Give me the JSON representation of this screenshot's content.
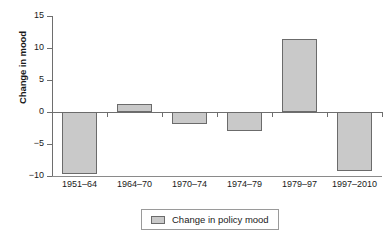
{
  "chart_data": {
    "type": "bar",
    "title": "",
    "xlabel": "",
    "ylabel": "Change in mood",
    "categories": [
      "1951–64",
      "1964–70",
      "1970–74",
      "1974–79",
      "1979–97",
      "1997–2010"
    ],
    "values": [
      -9.7,
      1.2,
      -1.8,
      -3.0,
      11.4,
      -9.2
    ],
    "series": [
      {
        "name": "Change in policy mood",
        "values": [
          -9.7,
          1.2,
          -1.8,
          -3.0,
          11.4,
          -9.2
        ],
        "color": "#c9c9c9"
      }
    ],
    "ylim": [
      -10,
      15
    ],
    "yticks": [
      15,
      10,
      5,
      0,
      -5,
      -10
    ],
    "ytick_labels": [
      "15",
      "10",
      "5",
      "0",
      "−5",
      "−10"
    ],
    "grid": false,
    "legend": {
      "position": "bottom",
      "entries": [
        {
          "label": "Change in policy mood",
          "color": "#c9c9c9"
        }
      ]
    },
    "colors": {
      "bar_fill": "#c9c9c9",
      "bar_border": "#6b6b6b",
      "axis": "#6e6e6e",
      "text": "#1a1a1a",
      "background": "#ffffff"
    }
  }
}
